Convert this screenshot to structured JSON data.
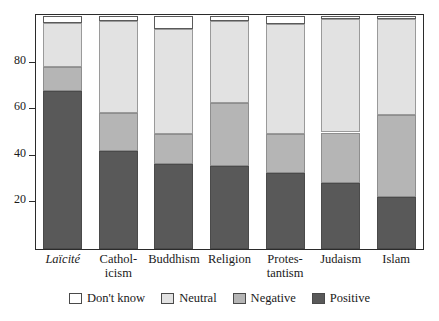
{
  "chart_data": {
    "type": "bar",
    "subtype": "stacked-bar-100",
    "title": "",
    "subtitle": "",
    "xlabel": "",
    "ylabel": "",
    "ylim": [
      0,
      100
    ],
    "yticks": [
      20,
      40,
      60,
      80
    ],
    "ytick_labels": [
      "20",
      "40",
      "60",
      "80"
    ],
    "grid": false,
    "legend_position": "bottom",
    "stack_order_bottom_to_top": [
      "Positive",
      "Negative",
      "Neutral",
      "Don't know"
    ],
    "categories": [
      "Laïcité",
      "Catholicism",
      "Buddhism",
      "Religion",
      "Protestantism",
      "Judaism",
      "Islam"
    ],
    "category_labels": [
      {
        "line1": "Laïcité",
        "line2": "",
        "italic": true
      },
      {
        "line1": "Cathol-",
        "line2": "icism",
        "italic": false
      },
      {
        "line1": "Buddhism",
        "line2": "",
        "italic": false
      },
      {
        "line1": "Religion",
        "line2": "",
        "italic": false
      },
      {
        "line1": "Protes-",
        "line2": "tantism",
        "italic": false
      },
      {
        "line1": "Judaism",
        "line2": "",
        "italic": false
      },
      {
        "line1": "Islam",
        "line2": "",
        "italic": false
      }
    ],
    "series": [
      {
        "name": "Positive",
        "color": "#595959",
        "values": [
          68,
          42,
          36.5,
          35.5,
          32.5,
          28.5,
          22.5
        ]
      },
      {
        "name": "Negative",
        "color": "#b5b5b5",
        "values": [
          10,
          16.5,
          13,
          27,
          17,
          21.5,
          35
        ]
      },
      {
        "name": "Neutral",
        "color": "#e2e2e2",
        "values": [
          19,
          39.5,
          45,
          35.5,
          47,
          48.5,
          41
        ]
      },
      {
        "name": "Don't know",
        "color": "#ffffff",
        "values": [
          3,
          2,
          5.5,
          2,
          3.5,
          1.5,
          1.5
        ]
      }
    ],
    "cumulative_tops": [
      {
        "category": "Laïcité",
        "positive": 68,
        "negative": 78,
        "neutral": 97,
        "dont_know": 100
      },
      {
        "category": "Catholicism",
        "positive": 42,
        "negative": 58.5,
        "neutral": 98,
        "dont_know": 100
      },
      {
        "category": "Buddhism",
        "positive": 36.5,
        "negative": 49.5,
        "neutral": 94.5,
        "dont_know": 100
      },
      {
        "category": "Religion",
        "positive": 35.5,
        "negative": 62.5,
        "neutral": 98,
        "dont_know": 100
      },
      {
        "category": "Protestantism",
        "positive": 32.5,
        "negative": 49.5,
        "neutral": 96.5,
        "dont_know": 100
      },
      {
        "category": "Judaism",
        "positive": 28.5,
        "negative": 50,
        "neutral": 98.5,
        "dont_know": 100
      },
      {
        "category": "Islam",
        "positive": 22.5,
        "negative": 57.5,
        "neutral": 98.5,
        "dont_know": 100
      }
    ]
  },
  "legend": {
    "items": [
      {
        "label": "Don't know",
        "swatch": "dk",
        "color": "#ffffff"
      },
      {
        "label": "Neutral",
        "swatch": "neutral",
        "color": "#e2e2e2"
      },
      {
        "label": "Negative",
        "swatch": "negative",
        "color": "#b5b5b5"
      },
      {
        "label": "Positive",
        "swatch": "positive",
        "color": "#595959"
      }
    ]
  },
  "colors": {
    "positive": "#595959",
    "negative": "#b5b5b5",
    "neutral": "#e2e2e2",
    "dont_know": "#ffffff",
    "frame": "#2b2b2b",
    "text": "#1a1a1a",
    "background": "#ffffff"
  }
}
